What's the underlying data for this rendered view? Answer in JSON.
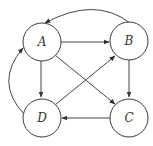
{
  "diagram": {
    "type": "directed-graph",
    "colors": {
      "stroke": "#3a3a3a",
      "label": "#333333",
      "background": "#ffffff"
    },
    "nodes": [
      {
        "id": "A",
        "label": "A"
      },
      {
        "id": "B",
        "label": "B"
      },
      {
        "id": "C",
        "label": "C"
      },
      {
        "id": "D",
        "label": "D"
      }
    ],
    "edges": [
      {
        "from": "A",
        "to": "B",
        "style": "straight"
      },
      {
        "from": "B",
        "to": "A",
        "style": "curved"
      },
      {
        "from": "A",
        "to": "D",
        "style": "straight"
      },
      {
        "from": "A",
        "to": "C",
        "style": "straight"
      },
      {
        "from": "D",
        "to": "B",
        "style": "straight"
      },
      {
        "from": "B",
        "to": "C",
        "style": "straight"
      },
      {
        "from": "C",
        "to": "D",
        "style": "straight"
      },
      {
        "from": "D",
        "to": "A",
        "style": "curved"
      }
    ]
  }
}
